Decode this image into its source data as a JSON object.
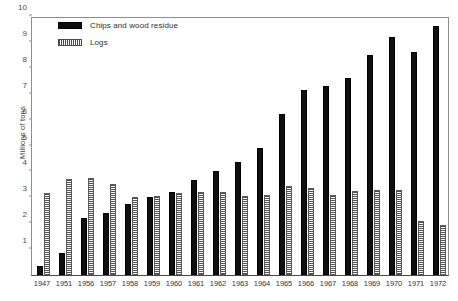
{
  "chart_data": {
    "type": "bar",
    "title": "",
    "xlabel": "",
    "ylabel": "Millions of tons",
    "ylim": [
      0,
      10
    ],
    "yticks": [
      0,
      1,
      2,
      3,
      4,
      5,
      6,
      7,
      8,
      9,
      10
    ],
    "ytick_labels": [
      "",
      "1",
      "2",
      "3",
      "4",
      "5",
      "6",
      "7",
      "8",
      "9",
      "10"
    ],
    "grid": false,
    "legend_position": "top-left",
    "categories": [
      "1947",
      "1951",
      "1956",
      "1957",
      "1958",
      "1959",
      "1960",
      "1961",
      "1962",
      "1963",
      "1964",
      "1965",
      "1966",
      "1967",
      "1968",
      "1969",
      "1970",
      "1971",
      "1972"
    ],
    "series": [
      {
        "name": "Chips and wood residue",
        "color": "#101010",
        "pattern": "solid",
        "values": [
          0.35,
          0.85,
          2.2,
          2.4,
          2.75,
          3.0,
          3.2,
          3.65,
          4.0,
          4.35,
          4.9,
          6.2,
          7.15,
          7.3,
          7.6,
          8.5,
          9.2,
          8.6,
          9.6
        ]
      },
      {
        "name": "Logs",
        "color": "#4f4f4f",
        "pattern": "horizontal-hatch",
        "values": [
          3.15,
          3.7,
          3.75,
          3.5,
          3.0,
          3.05,
          3.15,
          3.2,
          3.2,
          3.05,
          3.1,
          3.45,
          3.35,
          3.1,
          3.25,
          3.3,
          3.3,
          2.1,
          1.95
        ]
      }
    ]
  },
  "legend": {
    "items": [
      {
        "label": "Chips and wood residue"
      },
      {
        "label": "Logs"
      }
    ]
  },
  "axis": {
    "y_title": "Millions of tons"
  }
}
